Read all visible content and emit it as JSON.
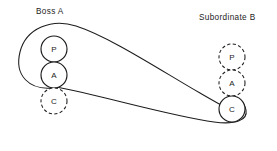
{
  "diagram": {
    "type": "transactional-analysis-crossed-transaction",
    "background_color": "#ffffff",
    "line_color": "#1c1c1c",
    "parties": [
      {
        "id": "boss-a",
        "label": "Boss A",
        "label_x": 36,
        "label_y": 14,
        "column_x": 54,
        "ego_states": [
          {
            "id": "p",
            "label": "P",
            "name": "parent",
            "cx": 54,
            "cy": 49,
            "r": 13,
            "style": "solid"
          },
          {
            "id": "a",
            "label": "A",
            "name": "adult",
            "cx": 54,
            "cy": 75,
            "r": 13,
            "style": "solid"
          },
          {
            "id": "c",
            "label": "C",
            "name": "child",
            "cx": 54,
            "cy": 101,
            "r": 13,
            "style": "dashed"
          }
        ]
      },
      {
        "id": "subordinate-b",
        "label": "Subordinate B",
        "label_x": 199,
        "label_y": 20,
        "column_x": 232,
        "ego_states": [
          {
            "id": "p",
            "label": "P",
            "name": "parent",
            "cx": 232,
            "cy": 57,
            "r": 13,
            "style": "dashed"
          },
          {
            "id": "a",
            "label": "A",
            "name": "adult",
            "cx": 232,
            "cy": 83,
            "r": 13,
            "style": "dashed"
          },
          {
            "id": "c",
            "label": "C",
            "name": "child",
            "cx": 232,
            "cy": 109,
            "r": 13,
            "style": "solid"
          }
        ]
      }
    ],
    "vectors": [
      {
        "id": "stimulus-vector",
        "name": "boss-adult-to-subordinate-child",
        "from": "boss-a.a",
        "to": "subordinate-b.c",
        "path": "M 52 88 C 30 90 14 76 20 52 C 26 28 52 18 76 26 C 110 37 160 70 200 93 C 214 101 226 108 236 113"
      },
      {
        "id": "response-vector",
        "name": "subordinate-child-to-boss-child",
        "from": "subordinate-b.c",
        "to": "boss-a.c",
        "path": "M 56 87 C 100 95 170 116 214 122 C 236 125 248 120 246 110 C 244 100 236 97 229 98"
      }
    ]
  }
}
